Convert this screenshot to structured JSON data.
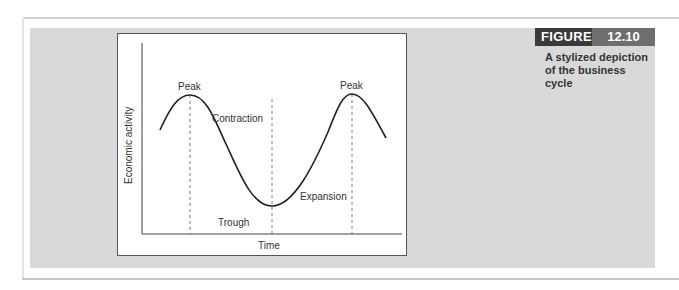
{
  "figure": {
    "label": "FIGURE",
    "number": "12.10",
    "caption": "A stylized depiction of the business cycle"
  },
  "diagram": {
    "type": "business-cycle",
    "x_axis_label": "Time",
    "y_axis_label": "Economic activity",
    "annotations": {
      "peak_left": "Peak",
      "peak_right": "Peak",
      "contraction": "Contraction",
      "trough": "Trough",
      "expansion": "Expansion"
    },
    "colors": {
      "figure_label_bg": "#3a3a3a",
      "figure_number_bg": "#6e6e6e",
      "panel_bg": "#d9d9d9",
      "curve": "#222222"
    }
  }
}
